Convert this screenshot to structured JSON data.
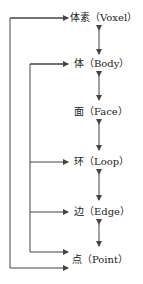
{
  "nodes": [
    {
      "id": "voxel",
      "label": "体素（Voxel）"
    },
    {
      "id": "body",
      "label": "体（Body）"
    },
    {
      "id": "face",
      "label": "面（Face）"
    },
    {
      "id": "loop",
      "label": "环（Loop）"
    },
    {
      "id": "edge",
      "label": "边（Edge）"
    },
    {
      "id": "point",
      "label": "点（Point）"
    }
  ],
  "colors": {
    "line": "#444444",
    "text": "#222222"
  }
}
